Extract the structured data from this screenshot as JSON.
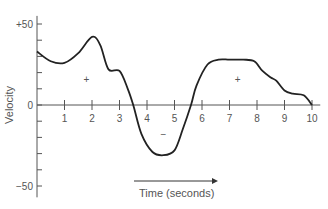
{
  "chart_data": {
    "type": "line",
    "title": "",
    "xlabel": "Time (seconds)",
    "ylabel": "Velocity",
    "xlim": [
      0,
      10
    ],
    "ylim": [
      -50,
      50
    ],
    "x_ticks": [
      "1",
      "2",
      "3",
      "4",
      "5",
      "6",
      "7",
      "8",
      "9",
      "10"
    ],
    "y_tick_labels": [
      "+50",
      "0",
      "−50"
    ],
    "grid": false,
    "legend": null,
    "annotations": [
      {
        "text": "+",
        "x": 1.8,
        "y": 16
      },
      {
        "text": "−",
        "x": 4.6,
        "y": -18
      },
      {
        "text": "+",
        "x": 7.3,
        "y": 16
      }
    ],
    "series": [
      {
        "name": "Velocity",
        "x": [
          0,
          0.5,
          1.0,
          1.5,
          2.0,
          2.3,
          2.6,
          3.0,
          3.3,
          3.5,
          3.8,
          4.2,
          4.6,
          5.0,
          5.3,
          5.6,
          5.8,
          6.2,
          6.6,
          7.0,
          7.5,
          7.9,
          8.2,
          8.5,
          8.7,
          9.0,
          9.3,
          9.7,
          10.0
        ],
        "values": [
          33,
          27,
          26,
          32,
          42,
          37,
          22,
          21,
          10,
          0,
          -18,
          -29,
          -31,
          -28,
          -15,
          0,
          12,
          25,
          28,
          28,
          28,
          27,
          21,
          17,
          15,
          9,
          7,
          6,
          0
        ]
      }
    ]
  }
}
